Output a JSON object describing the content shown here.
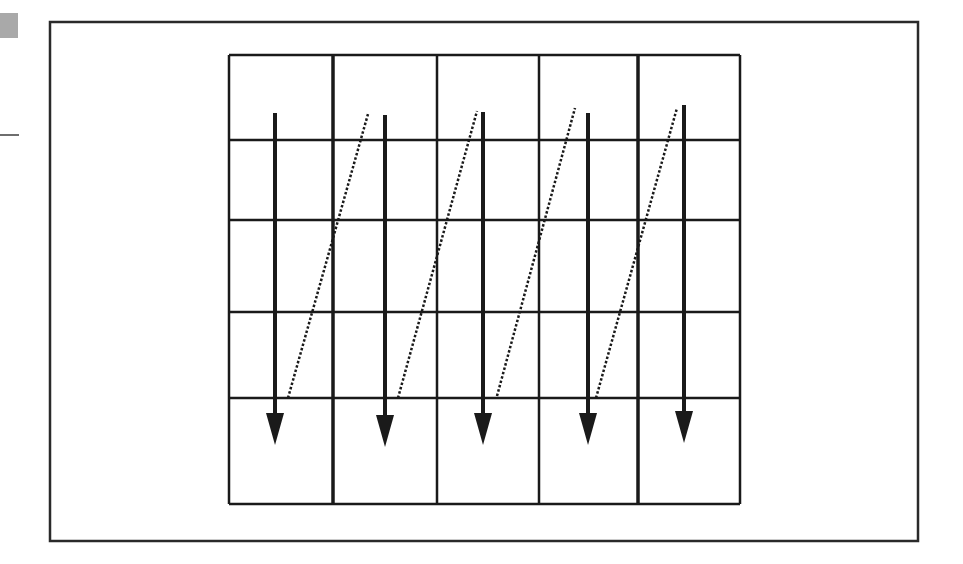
{
  "diagram": {
    "title": "",
    "colors": {
      "stroke": "#1a1a1a",
      "frame": "#2a2a2a",
      "swatch": "#a9a9a9",
      "background": "#ffffff"
    },
    "frame": {
      "x": 50,
      "y": 22,
      "width": 868,
      "height": 519
    },
    "grid": {
      "rows": 5,
      "cols": 5,
      "col_lines": [
        229,
        333,
        437,
        539,
        638,
        740
      ],
      "row_lines": [
        55,
        140,
        220,
        312,
        398,
        504
      ],
      "thick_col_lines": [
        333,
        638
      ]
    },
    "arrows": [
      {
        "x": 275,
        "y1": 113,
        "y2": 445
      },
      {
        "x": 385,
        "y1": 115,
        "y2": 447
      },
      {
        "x": 483,
        "y1": 112,
        "y2": 445
      },
      {
        "x": 588,
        "y1": 113,
        "y2": 445
      },
      {
        "x": 684,
        "y1": 105,
        "y2": 443
      }
    ],
    "return_paths": [
      {
        "x1": 288,
        "y1": 398,
        "x2": 368,
        "y2": 114
      },
      {
        "x1": 398,
        "y1": 398,
        "x2": 477,
        "y2": 111
      },
      {
        "x1": 497,
        "y1": 396,
        "x2": 575,
        "y2": 108
      },
      {
        "x1": 596,
        "y1": 398,
        "x2": 677,
        "y2": 108
      }
    ]
  }
}
